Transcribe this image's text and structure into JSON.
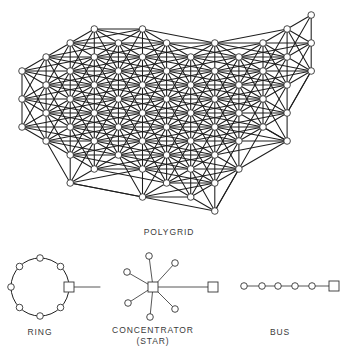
{
  "colors": {
    "line": "#1e1e1e",
    "thin_line": "#444444",
    "node_fill": "#ffffff",
    "node_stroke": "#333333",
    "text": "#3a3a3a"
  },
  "polygrid": {
    "label": "POLYGRID",
    "label_pos": [
      169,
      227
    ],
    "grid": {
      "x0": 22,
      "dx": 24.1,
      "y0": 15,
      "dy": 14
    },
    "node_radius": 3.3,
    "rows": [
      {
        "r": 0,
        "cols": [
          12
        ]
      },
      {
        "r": 1,
        "cols": [
          3,
          5,
          11
        ]
      },
      {
        "r": 2,
        "cols": [
          2,
          4,
          6,
          8,
          10,
          12
        ]
      },
      {
        "r": 3,
        "cols": [
          1,
          3,
          5,
          7,
          9,
          11
        ]
      },
      {
        "r": 4,
        "cols": [
          0,
          2,
          4,
          6,
          8,
          10,
          12
        ]
      },
      {
        "r": 5,
        "cols": [
          1,
          3,
          5,
          7,
          9,
          11
        ]
      },
      {
        "r": 6,
        "cols": [
          0,
          2,
          4,
          6,
          8,
          10
        ]
      },
      {
        "r": 7,
        "cols": [
          1,
          3,
          5,
          7,
          9,
          11
        ]
      },
      {
        "r": 8,
        "cols": [
          0,
          2,
          4,
          6,
          8,
          10
        ]
      },
      {
        "r": 9,
        "cols": [
          1,
          3,
          5,
          7,
          9,
          11
        ]
      },
      {
        "r": 10,
        "cols": [
          2,
          4,
          6,
          8
        ]
      },
      {
        "r": 11,
        "cols": [
          3,
          5,
          7,
          9
        ]
      },
      {
        "r": 12,
        "cols": [
          2,
          6,
          8
        ]
      },
      {
        "r": 13,
        "cols": [
          5,
          7
        ]
      },
      {
        "r": 14,
        "cols": [
          8
        ]
      }
    ],
    "link_offsets": [
      [
        2,
        0
      ],
      [
        0,
        2
      ],
      [
        1,
        1
      ],
      [
        -1,
        1
      ],
      [
        1,
        3
      ],
      [
        -1,
        3
      ],
      [
        3,
        1
      ],
      [
        -3,
        1
      ]
    ],
    "extra_links": [
      [
        [
          2,
          12
        ],
        [
          5,
          13
        ]
      ],
      [
        [
          9,
          11
        ],
        [
          11,
          9
        ]
      ],
      [
        [
          8,
          14
        ],
        [
          9,
          11
        ]
      ],
      [
        [
          10,
          8
        ],
        [
          11,
          9
        ]
      ],
      [
        [
          12,
          4
        ],
        [
          11,
          7
        ]
      ]
    ]
  },
  "ring": {
    "label": "RING",
    "label_pos": [
      40,
      327
    ],
    "center": [
      40,
      287
    ],
    "radius": 29,
    "node_angles_deg": [
      90,
      45,
      135,
      180,
      225,
      270,
      315
    ],
    "node_radius": 3.3,
    "concentrator": {
      "center": [
        69,
        287
      ],
      "size": 10
    },
    "line_to": [
      100,
      287
    ]
  },
  "star": {
    "label": "CONCENTRATOR",
    "sublabel": "(STAR)",
    "label_pos": [
      153,
      325
    ],
    "hub": {
      "center": [
        153,
        287
      ],
      "size": 10
    },
    "spokes": [
      [
        149,
        256
      ],
      [
        175,
        263
      ],
      [
        127,
        272
      ],
      [
        128,
        303
      ],
      [
        150,
        317
      ],
      [
        175,
        309
      ]
    ],
    "node_radius": 3.3,
    "remote": {
      "center": [
        213,
        287
      ],
      "size": 10
    }
  },
  "bus": {
    "label": "BUS",
    "label_pos": [
      280,
      327
    ],
    "y": 286,
    "nodes_x": [
      244,
      262,
      278,
      295,
      312
    ],
    "node_radius": 3.3,
    "terminal": {
      "center": [
        334,
        286
      ],
      "size": 10
    }
  }
}
